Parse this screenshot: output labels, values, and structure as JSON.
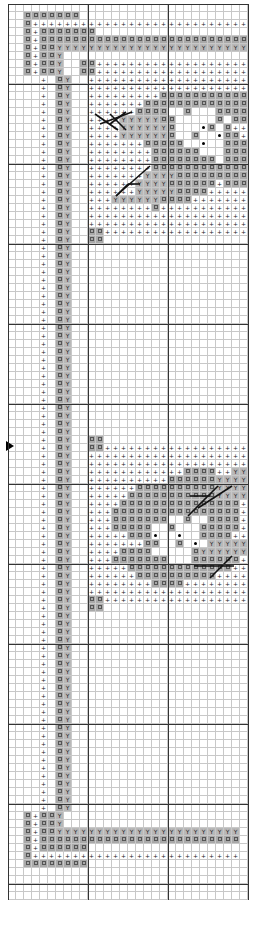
{
  "chart": {
    "title": "",
    "cell_size_px": 8,
    "cols": 30,
    "rows": 112,
    "legend_symbols": {
      "x": "dark-gray-box-symbol",
      "y": "gray-Y-symbol",
      "p": "plus-symbol",
      "d": "black-dot-symbol",
      ".": "empty"
    },
    "colors": {
      "grid": "#c8c8c8",
      "major_grid": "#333333",
      "fill_dark": "#a9a9a9",
      "fill_y": "#b8b8b8",
      "backstitch": "#111111"
    },
    "center_marker": "arrow-right",
    "grid_rows": [
      "..............................",
      "..xxxxxxx.....................",
      "..xpppppppppppppppppppppppppppp",
      "..xpxxxxxxx...................",
      "..xpxxxxxxxxxxxxxxxxxxxxxxxxxx",
      "..xpxxyyyyyyyyyyyyyyyyyyyyyyyy",
      "..xpxxy.......................",
      "..xpxxy..xxpppppppppppppppppppp",
      "..xpxxy..xxppppppppppppppppppppp",
      "....p.xy..pppppppppppppppppppppp",
      "....p.xy..pppppppppppppppppppppp",
      "....p.xy..pppppppppxxxxxxxxxxxpp",
      "....p.xy..pppppppxxxxxxxxxxxxxpp",
      "....p.xy..ppppppxxxx..x...xxxxpp",
      "....p.xy..ppppyyyyyxx.....x.xxpp",
      "....p.xy..ppppyyyyyyx...dx.xpppp",
      "....p.xy..ppppyyyyyyx..x..dxxppp",
      "....p.xy..pppppppxxxxx..d..xxxpp",
      "....p.xy..ppppppppxxxxxx...xxxxp",
      "....p.xy..ppppppppxxxxxxxx.xxxxp",
      "....p.xy..ppppppppxxxxxxxxxxxxxp",
      "....p.xy..pppppppyyyyxxxxxxxxxpp",
      "....p.xy..ppppppyyyyxxxxxxpxxxpp",
      "....p.xy..ppppppyyyyyxxxxppppppp",
      "....p.xy..pppyyyyyyxxxxppppppppp",
      "....p.xy..ppppppppxppppppppppppp",
      "....p.xy..pppppppppppppppppppppp",
      "....p.xy..pppppppppppppppppppppp",
      "....p.xy..xxpppppppppppppppppppp",
      "....p.xy..xx.....................",
      "....p.xy......................",
      "....p.xy......................",
      "....p.xy......................",
      "....p.xy......................",
      "....p.xy......................",
      "....p.xy......................",
      "....p.xy......................",
      "....p.xy......................",
      "....p.xy......................",
      "....p.xy......................",
      "....p.xy......................",
      "....p.xy......................",
      "....p.xy......................",
      "....p.xy......................",
      "....p.xy......................",
      "....p.xy......................",
      "....p.xy......................",
      "....p.xy......................",
      "....p.xy......................",
      "....p.xy......................",
      "....p.xy......................",
      "....p.xy......................",
      "....p.xy......................",
      "....p.xy......................",
      "....p.xy..xx..................",
      "....p.xy..xxpppppppppppppppppp",
      "....p.xy..pppppppppppppppppppp",
      "....p.xy..pppppppppppppppppppp",
      "....p.xy..ppppppppppppxxxxppyyy",
      "....p.xy..ppppppppppxxxxxxyyyyy",
      "....p.xy..ppppppxxxxxxxxxxyyyyp",
      "....p.xy..pppppxxxxxxxxxxxyyyyp",
      "....p.xy..ppppxxxxxxxxxxxxxxxpp",
      "....p.xy..pppxxxxxxxxxxxxxxxxpp",
      "....p.xy..pppxxxxxxx..x..xxxxpp",
      "....p.xy..pppxxxxx..x...xxxxxpp",
      "....p.xy..pppppxxxd..d..xxxxpp",
      "....p.xy..pppppppxx..x.d.yyyyyy",
      "....p.xy..ppppxxxx.....xyyyyyyp",
      "....p.xy..pppxxxxxxx...xxxxxxpp",
      "....p.xy..pppppxxxxxxxxxxxxxppp",
      "....p.xy..ppppppxxxxxxxxxxpppppp",
      "....p.xy..ppppppppxxxxpppppppppp",
      "....p.xy..pppppppppppppppppppppp",
      "....p.xy..xxpppppppppppppppppppp",
      "....p.xy..xx.....................",
      "....p.xy......................",
      "....p.xy......................",
      "....p.xy......................",
      "....p.xy......................",
      "....p.xy......................",
      "....p.xy......................",
      "....p.xy......................",
      "....p.xy......................",
      "....p.xy......................",
      "....p.xy......................",
      "....p.xy......................",
      "....p.xy......................",
      "....p.xy......................",
      "....p.xy......................",
      "....p.xy......................",
      "....p.xy......................",
      "....p.xy......................",
      "....p.xy......................",
      "....p.xy......................",
      "....p.xy......................",
      "....p.xy......................",
      "....p.xy......................",
      "....p.xy......................",
      "....p.xy......................",
      "....p.xy......................",
      "..xpxxy.......................",
      "..xpxxy.......................",
      "..xpxxyyyyyyyyyyyyyyyyyyyyyyy.",
      "..xpxxxxxxxxxxxxxxxxxxxxxxxxx.",
      "..xpxxxxxx....................",
      "..xpppppppppppppppppppppppppp.",
      "..xxxxxxxx....................",
      "..............................",
      "..............................",
      "..............................",
      ".............................."
    ],
    "backstitch_lines": [
      [
        95,
        114,
        118,
        130
      ],
      [
        110,
        114,
        126,
        130
      ],
      [
        100,
        124,
        132,
        112
      ],
      [
        110,
        124,
        126,
        112
      ],
      [
        116,
        196,
        150,
        166
      ],
      [
        128,
        184,
        140,
        184
      ],
      [
        116,
        196,
        128,
        184
      ],
      [
        188,
        516,
        218,
        486
      ],
      [
        198,
        508,
        232,
        486
      ],
      [
        190,
        496,
        210,
        496
      ],
      [
        194,
        566,
        234,
        566
      ],
      [
        210,
        578,
        232,
        556
      ]
    ],
    "major_lines_every": 10
  }
}
